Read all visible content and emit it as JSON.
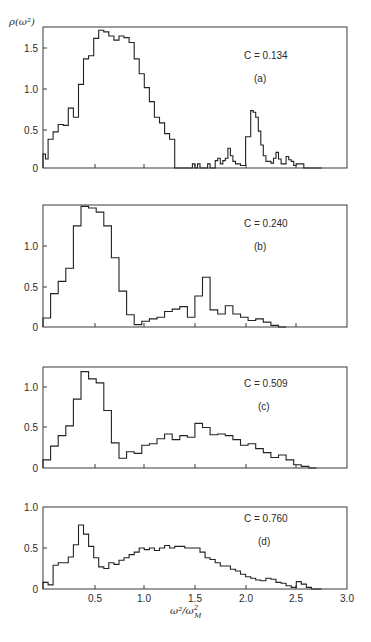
{
  "figure": {
    "ylabel": "ρ(ω²)",
    "xlabel_main": "ω²/ω",
    "xlabel_sup": "2",
    "xlabel_sub": "M",
    "x_ticks": [
      "0.5",
      "1.0",
      "1.5",
      "2.0",
      "2.5",
      "3.0"
    ],
    "panels": [
      {
        "id": "a",
        "label": "(a)",
        "concentration": "C = 0.134",
        "y_ticks": [
          "1.5",
          "1.0",
          "0.5",
          "0"
        ]
      },
      {
        "id": "b",
        "label": "(b)",
        "concentration": "C = 0.240",
        "y_ticks": [
          "1.0",
          "0.5",
          "0"
        ]
      },
      {
        "id": "c",
        "label": "(c)",
        "concentration": "C = 0.509",
        "y_ticks": [
          "1.0",
          "0.5",
          "0"
        ]
      },
      {
        "id": "d",
        "label": "(d)",
        "concentration": "C = 0.760",
        "y_ticks": [
          "1.0",
          "0.5",
          "0"
        ]
      }
    ]
  },
  "chart_data": [
    {
      "type": "bar",
      "subtype": "histogram-step",
      "title": "C = 0.134 (a)",
      "xlabel": "ω²/ω_M²",
      "ylabel": "ρ(ω²)",
      "xlim": [
        0,
        3.0
      ],
      "ylim": [
        0,
        1.75
      ],
      "y_ticks": [
        0,
        0.5,
        1.0,
        1.5
      ],
      "bin_width": 0.025,
      "x_start": 0.0,
      "values": [
        0.17,
        0.11,
        0.35,
        0.35,
        0.44,
        0.44,
        0.53,
        0.53,
        0.52,
        0.52,
        0.73,
        0.73,
        0.62,
        0.62,
        1.02,
        1.02,
        1.33,
        1.33,
        1.37,
        1.37,
        1.58,
        1.58,
        1.68,
        1.68,
        1.66,
        1.66,
        1.61,
        1.61,
        1.56,
        1.56,
        1.61,
        1.61,
        1.59,
        1.59,
        1.53,
        1.53,
        1.33,
        1.33,
        1.15,
        1.15,
        0.98,
        0.98,
        0.81,
        0.81,
        0.62,
        0.62,
        0.55,
        0.55,
        0.42,
        0.42,
        0.35,
        0.35,
        0,
        0,
        0,
        0,
        0,
        0,
        0,
        0.05,
        0,
        0.05,
        0,
        0,
        0,
        0.05,
        0,
        0,
        0.09,
        0.12,
        0.05,
        0.09,
        0.12,
        0.24,
        0.15,
        0.08,
        0.05,
        0.05,
        0.03,
        0.03,
        0.38,
        0.38,
        0.7,
        0.68,
        0.62,
        0.45,
        0.28,
        0.15,
        0.08,
        0.08,
        0.06,
        0.12,
        0.19,
        0.11,
        0.05,
        0.05,
        0.14,
        0.1,
        0.08,
        0.03,
        0.05,
        0.05,
        0.05,
        0,
        0,
        0,
        0,
        0,
        0,
        0
      ]
    },
    {
      "type": "bar",
      "subtype": "histogram-step",
      "title": "C = 0.240 (b)",
      "xlabel": "ω²/ω_M²",
      "ylabel": "ρ(ω²)",
      "xlim": [
        0,
        3.0
      ],
      "ylim": [
        0,
        1.5
      ],
      "y_ticks": [
        0,
        0.5,
        1.0
      ],
      "bin_width": 0.075,
      "x_start": 0.0,
      "values": [
        0.11,
        0.41,
        0.56,
        0.72,
        1.24,
        1.48,
        1.46,
        1.41,
        1.24,
        0.85,
        0.44,
        0.15,
        0.03,
        0.07,
        0.1,
        0.12,
        0.19,
        0.22,
        0.25,
        0.12,
        0.38,
        0.61,
        0.21,
        0.16,
        0.26,
        0.16,
        0.12,
        0.08,
        0.1,
        0.06,
        0.02,
        0
      ]
    },
    {
      "type": "bar",
      "subtype": "histogram-step",
      "title": "C = 0.509 (c)",
      "xlabel": "ω²/ω_M²",
      "ylabel": "ρ(ω²)",
      "xlim": [
        0,
        3.0
      ],
      "ylim": [
        0,
        1.25
      ],
      "y_ticks": [
        0,
        0.5,
        1.0
      ],
      "bin_width": 0.075,
      "x_start": 0.0,
      "values": [
        0.1,
        0.27,
        0.4,
        0.52,
        0.85,
        1.19,
        1.1,
        1.05,
        0.71,
        0.31,
        0.12,
        0.2,
        0.18,
        0.28,
        0.3,
        0.36,
        0.42,
        0.35,
        0.4,
        0.38,
        0.55,
        0.5,
        0.41,
        0.42,
        0.4,
        0.35,
        0.28,
        0.3,
        0.24,
        0.19,
        0.13,
        0.16,
        0.1,
        0.04,
        0.02,
        0
      ]
    },
    {
      "type": "bar",
      "subtype": "histogram-step",
      "title": "C = 0.760 (d)",
      "xlabel": "ω²/ω_M²",
      "ylabel": "ρ(ω²)",
      "xlim": [
        0,
        3.0
      ],
      "ylim": [
        0,
        1.0
      ],
      "y_ticks": [
        0,
        0.5,
        1.0
      ],
      "x_ticks": [
        0.5,
        1.0,
        1.5,
        2.0,
        2.5,
        3.0
      ],
      "bin_width": 0.05,
      "x_start": 0.0,
      "values": [
        0.08,
        0.05,
        0.29,
        0.32,
        0.32,
        0.39,
        0.54,
        0.78,
        0.67,
        0.52,
        0.38,
        0.27,
        0.25,
        0.32,
        0.3,
        0.35,
        0.38,
        0.42,
        0.45,
        0.5,
        0.48,
        0.5,
        0.47,
        0.5,
        0.53,
        0.5,
        0.52,
        0.52,
        0.5,
        0.5,
        0.5,
        0.45,
        0.38,
        0.36,
        0.32,
        0.28,
        0.28,
        0.24,
        0.22,
        0.18,
        0.15,
        0.13,
        0.11,
        0.1,
        0.13,
        0.12,
        0.08,
        0.07,
        0.04,
        0.02,
        0.09,
        0.06,
        0.02,
        0,
        0
      ]
    }
  ]
}
